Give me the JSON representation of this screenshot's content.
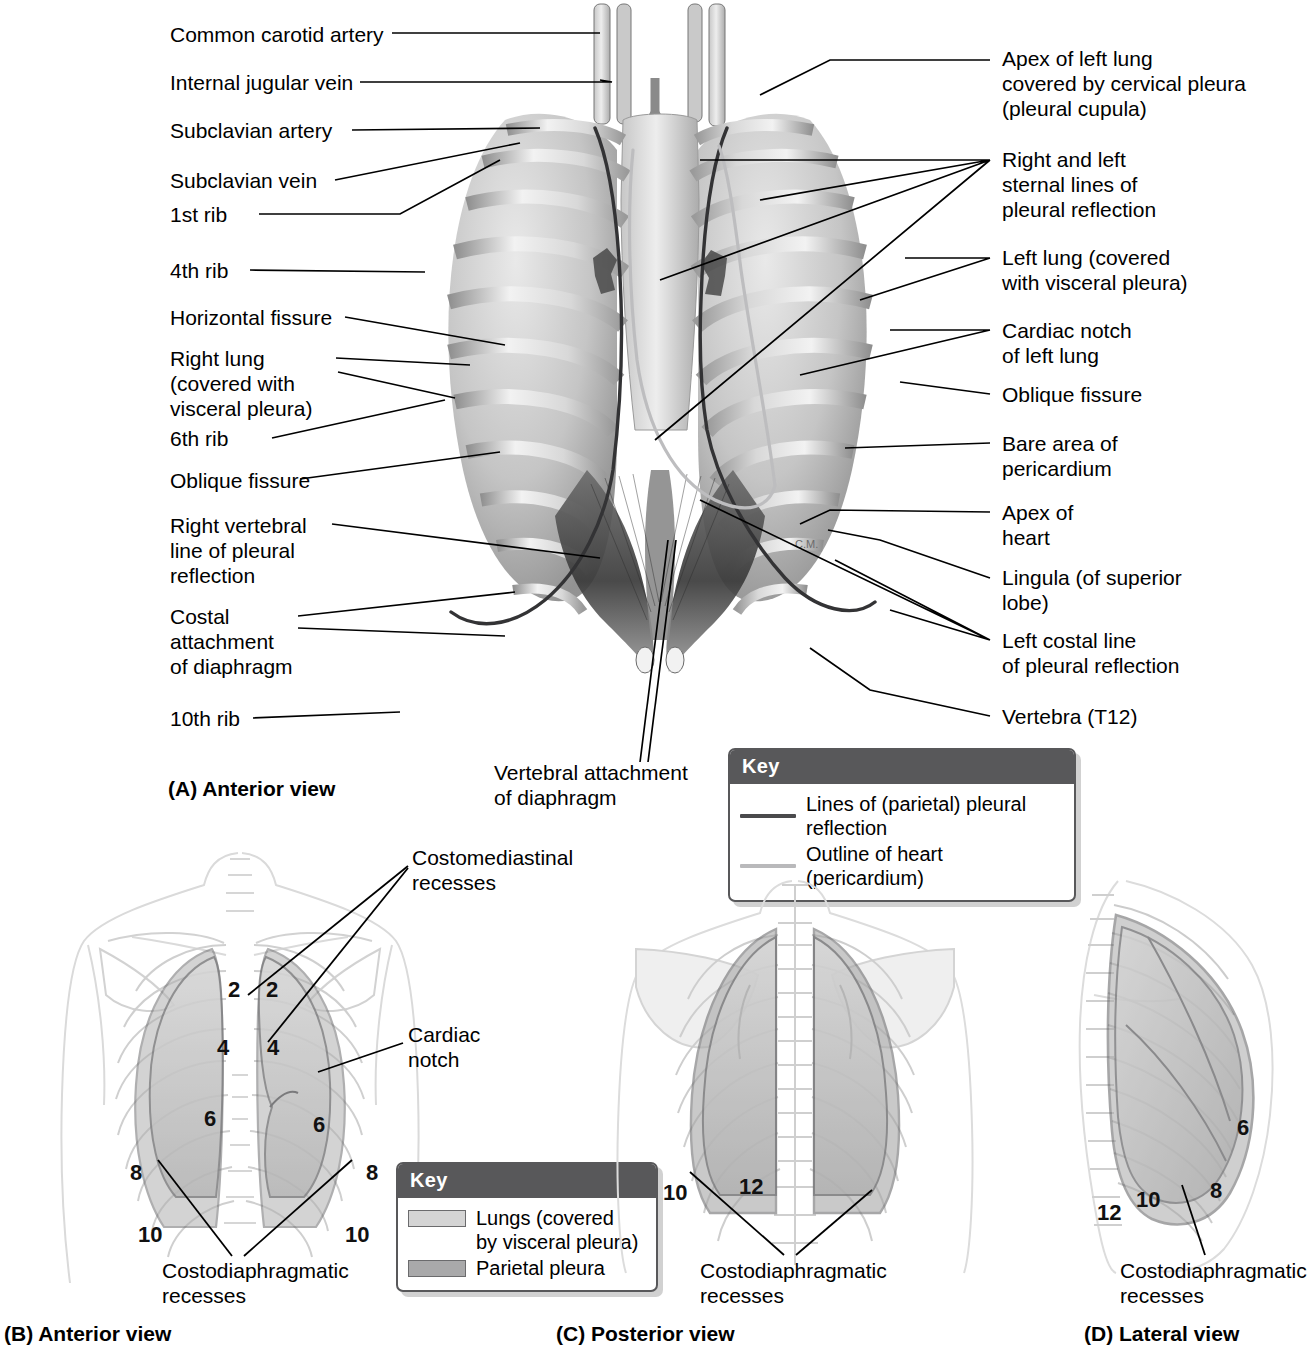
{
  "figure": {
    "domain": "anatomy-illustration"
  },
  "panels": [
    {
      "id": "A",
      "caption": "(A) Anterior view"
    },
    {
      "id": "B",
      "caption": "(B) Anterior view"
    },
    {
      "id": "C",
      "caption": "(C) Posterior view"
    },
    {
      "id": "D",
      "caption": "(D) Lateral view"
    }
  ],
  "panel_a": {
    "labels_left": [
      {
        "text": "Common carotid artery"
      },
      {
        "text": "Internal jugular vein"
      },
      {
        "text": "Subclavian artery"
      },
      {
        "text": "Subclavian vein"
      },
      {
        "text": "1st rib"
      },
      {
        "text": "4th rib"
      },
      {
        "text": "Horizontal fissure"
      },
      {
        "text": "Right lung\n(covered with\nvisceral pleura)"
      },
      {
        "text": "6th rib"
      },
      {
        "text": "Oblique fissure"
      },
      {
        "text": "Right vertebral\nline of pleural\nreflection"
      },
      {
        "text": "Costal\nattachment\nof diaphragm"
      },
      {
        "text": "10th rib"
      }
    ],
    "labels_right": [
      {
        "text": "Apex of left lung\ncovered by cervical pleura\n(pleural cupula)"
      },
      {
        "text": "Right and left\nsternal lines of\npleural  reflection"
      },
      {
        "text": "Left lung (covered\nwith visceral pleura)"
      },
      {
        "text": "Cardiac notch\nof left lung"
      },
      {
        "text": "Oblique fissure"
      },
      {
        "text": "Bare area of\npericardium"
      },
      {
        "text": "Apex of\nheart"
      },
      {
        "text": "Lingula (of superior\nlobe)"
      },
      {
        "text": "Left costal line\nof pleural reflection"
      },
      {
        "text": "Vertebra (T12)"
      }
    ],
    "label_center": {
      "text": "Vertebral attachment\nof diaphragm"
    },
    "key": {
      "title": "Key",
      "items": [
        {
          "label": "Lines of (parietal) pleural reflection",
          "swatch": "line",
          "color": "#4a4a4c"
        },
        {
          "label": "Outline of heart (pericardium)",
          "swatch": "line",
          "color": "#b9b9bb"
        }
      ]
    }
  },
  "panel_b": {
    "labels": [
      {
        "text": "Costomediastinal\nrecesses"
      },
      {
        "text": "Cardiac\nnotch"
      },
      {
        "text": "Costodiaphragmatic\nrecesses"
      }
    ],
    "rib_numbers": [
      "2",
      "2",
      "4",
      "4",
      "6",
      "6",
      "8",
      "8",
      "10",
      "10"
    ],
    "key": {
      "title": "Key",
      "items": [
        {
          "label": "Lungs (covered\nby visceral pleura)",
          "swatch": "box",
          "color": "#d4d4d4"
        },
        {
          "label": "Parietal pleura",
          "swatch": "box",
          "color": "#a9a9aa"
        }
      ]
    }
  },
  "panel_c": {
    "labels": [
      {
        "text": "Costodiaphragmatic\nrecesses"
      }
    ],
    "rib_numbers": [
      "10",
      "12"
    ]
  },
  "panel_d": {
    "labels": [
      {
        "text": "Costodiaphragmatic\nrecesses"
      }
    ],
    "rib_numbers": [
      "6",
      "8",
      "10",
      "12"
    ]
  },
  "colors": {
    "key_header": "#58585a",
    "key_border": "#58585a",
    "pleural_line": "#3c3c3e",
    "pericardium_line": "#b9b9bb",
    "lung_fill": "#d4d4d4",
    "parietal_fill": "#a9a9aa",
    "body_outline": "#dcdcdc",
    "leader": "#000000"
  }
}
